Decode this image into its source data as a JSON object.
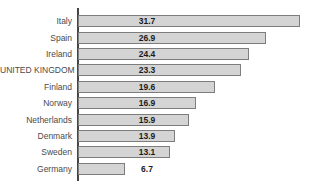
{
  "chart_data": {
    "type": "bar",
    "orientation": "horizontal",
    "title": "",
    "xlabel": "",
    "ylabel": "",
    "categories": [
      "Italy",
      "Spain",
      "Ireland",
      "UNITED KINGDOM",
      "Finland",
      "Norway",
      "Netherlands",
      "Denmark",
      "Sweden",
      "Germany"
    ],
    "values": [
      31.7,
      26.9,
      24.4,
      23.3,
      19.6,
      16.9,
      15.9,
      13.9,
      13.1,
      6.7
    ],
    "value_labels": [
      "31.7",
      "26.9",
      "24.4",
      "23.3",
      "19.6",
      "16.9",
      "15.9",
      "13.9",
      "13.1",
      "6.7"
    ],
    "xlim": [
      0,
      32
    ],
    "grid": false,
    "legend": null,
    "value_labels_shown": true,
    "colors": {
      "bar_fill": "#d4d4d4",
      "bar_border": "#7d7d7d",
      "axis_line": "#454545",
      "category_text": "#4a4a4a",
      "value_text": "#1b1b1b",
      "background": "#ffffff"
    }
  }
}
